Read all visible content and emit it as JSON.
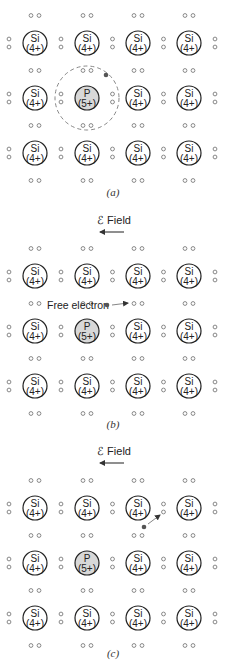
{
  "figure": {
    "colors": {
      "atom_outline": "#222222",
      "donor_fill": "#d8d8d8",
      "electron_ring": "#888888",
      "free_electron": "#555555",
      "orbit_dash": "#888888",
      "arrow": "#333333"
    },
    "lattice": {
      "columns": [
        35,
        87,
        138,
        189
      ],
      "host_atom": {
        "symbol": "Si",
        "charge": "(4+)"
      },
      "donor_atom": {
        "symbol": "P",
        "charge": "(5+)",
        "row": 1,
        "col": 1
      }
    },
    "panels": [
      {
        "id": "a",
        "label": "(a)",
        "field_label": "",
        "atom_rows": [
          43,
          98,
          153
        ],
        "orbit": {
          "cx": 87,
          "cy": 98,
          "r": 32
        },
        "electron": {
          "x": 106,
          "y": 75
        },
        "label_y": 196
      },
      {
        "id": "b",
        "label": "(b)",
        "field_label": "ℰ Field",
        "field_y": 224,
        "atom_rows": [
          276,
          331,
          386
        ],
        "free_electron_label": "Free electron",
        "electron": {
          "x": 107,
          "y": 305
        },
        "arrow": {
          "x1": 112,
          "y1": 305,
          "x2": 128,
          "y2": 303
        },
        "label_y": 428
      },
      {
        "id": "c",
        "label": "(c)",
        "field_label": "ℰ Field",
        "field_y": 455,
        "atom_rows": [
          508,
          563,
          618
        ],
        "electron": {
          "x": 144,
          "y": 527
        },
        "arrow": {
          "x1": 148,
          "y1": 524,
          "x2": 160,
          "y2": 515
        },
        "label_y": 657
      }
    ]
  }
}
